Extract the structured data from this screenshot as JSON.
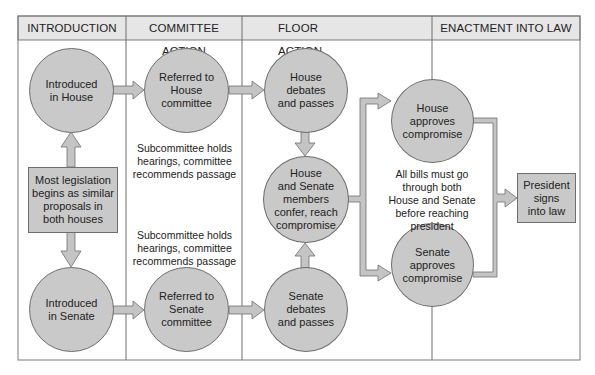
{
  "columns": [
    {
      "label": "INTRODUCTION"
    },
    {
      "label": "COMMITTEE ACTION"
    },
    {
      "label": "FLOOR ACTION"
    },
    {
      "label": "ENACTMENT INTO LAW"
    }
  ],
  "nodes": {
    "introduced_house": "Introduced\nin House",
    "introduced_senate": "Introduced\nin Senate",
    "origin_box": "Most legislation\nbegins as similar\nproposals in\nboth houses",
    "referred_house": "Referred to\nHouse\ncommittee",
    "referred_senate": "Referred to\nSenate\ncommittee",
    "house_debates": "House\ndebates\nand passes",
    "senate_debates": "Senate\ndebates\nand passes",
    "conference": "House\nand Senate\nmembers\nconfer, reach\ncompromise",
    "house_approves": "House\napproves\ncompromise",
    "senate_approves": "Senate\napproves\ncompromise",
    "president": "President\nsigns\ninto law"
  },
  "notes": {
    "committee_house": "Subcommittee holds\nhearings, committee\nrecommends passage",
    "committee_senate": "Subcommittee holds\nhearings, committee\nrecommends passage",
    "both_houses": "All bills must go\nthrough both\nHouse and Senate\nbefore reaching\npresident"
  },
  "colors": {
    "node_fill": "#c9c9c9",
    "header_fill": "#e6e6e6",
    "stroke": "#6e6e6e",
    "arrow_fill": "#c4c4c4"
  }
}
